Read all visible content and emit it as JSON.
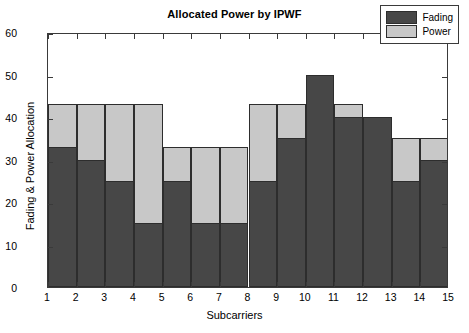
{
  "chart_data": {
    "type": "bar",
    "title": "Allocated Power by IPWF",
    "xlabel": "Subcarriers",
    "ylabel": "Fading & Power Allocation",
    "stacked": true,
    "grid": false,
    "legend_position": "top-right",
    "xlim": [
      1,
      15
    ],
    "ylim": [
      0,
      60
    ],
    "xticks": [
      "1",
      "2",
      "3",
      "4",
      "5",
      "6",
      "7",
      "8",
      "9",
      "10",
      "11",
      "12",
      "13",
      "14",
      "15"
    ],
    "yticks": [
      "0",
      "10",
      "20",
      "30",
      "40",
      "50",
      "60"
    ],
    "categories": [
      "1",
      "2",
      "3",
      "4",
      "5",
      "6",
      "7",
      "8",
      "9",
      "10",
      "11",
      "12",
      "13",
      "14"
    ],
    "series": [
      {
        "name": "Fading",
        "color": "#474747",
        "values": [
          33,
          30,
          25,
          15,
          25,
          15,
          15,
          25,
          35,
          50,
          40,
          40,
          25,
          30
        ]
      },
      {
        "name": "Power",
        "color": "#c8c8c8",
        "values": [
          10,
          13,
          18,
          28,
          8,
          18,
          18,
          18,
          8,
          0,
          3,
          0,
          10,
          5
        ]
      }
    ],
    "totals": [
      43,
      43,
      43,
      43,
      33,
      33,
      33,
      43,
      43,
      50,
      43,
      40,
      35,
      35
    ]
  },
  "legend": {
    "items": [
      {
        "label": "Fading"
      },
      {
        "label": "Power"
      }
    ]
  }
}
